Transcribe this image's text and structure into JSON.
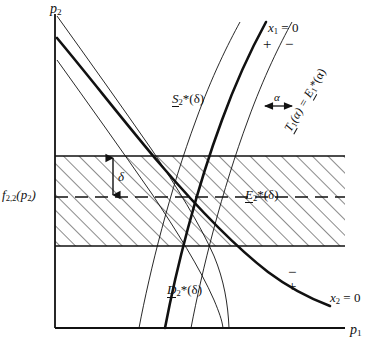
{
  "figure": {
    "type": "economic-phase-diagram",
    "background_color": "#ffffff",
    "line_color": "#111111",
    "axes": {
      "y_axis_label": "p",
      "y_axis_label_sub": "2",
      "x_axis_label": "p",
      "x_axis_label_sub": "1",
      "origin_x": 55,
      "origin_y": 328,
      "y_axis_top": 14,
      "x_axis_right": 345
    },
    "band": {
      "top_y": 156,
      "bottom_y": 246,
      "center_dashed_y": 197,
      "hatch_angle_deg": 45,
      "hatch_spacing": 11,
      "delta_label": "δ",
      "delta_arrow_top_y": 156,
      "delta_arrow_bottom_y": 197
    },
    "axis_left_value_label": {
      "text": "f",
      "subscript": "2,2",
      "paren": "(p",
      "paren_sub": "2",
      "paren_close": ")",
      "full_text": "f2,2(p2)"
    },
    "curves": [
      {
        "name": "x1-zero-curve",
        "style": "thick",
        "label": "x1 = 0",
        "label_main": "x",
        "label_sub": "1",
        "label_tail": " = 0",
        "sign_left": "+",
        "sign_right": "−"
      },
      {
        "name": "x2-zero-curve",
        "style": "thick",
        "label": "x2 = 0",
        "label_main": "x",
        "label_sub": "2",
        "label_tail": " = 0",
        "sign_upper": "−",
        "sign_lower": "+"
      },
      {
        "name": "supply-offset-curve-left",
        "style": "thin"
      },
      {
        "name": "supply-offset-curve-right",
        "style": "thin"
      },
      {
        "name": "demand-offset-curve-left",
        "style": "thin"
      },
      {
        "name": "demand-offset-curve-right",
        "style": "thin"
      }
    ],
    "region_labels": [
      {
        "name": "supply-region-label",
        "letter": "S",
        "sub": "2",
        "tail": "*(δ)",
        "underlined_letter": true,
        "x": 172,
        "y": 92
      },
      {
        "name": "excess-region-label",
        "letter": "E",
        "sub": "2",
        "tail": "*(δ)",
        "underlined_letter": true,
        "x": 245,
        "y": 188
      },
      {
        "name": "demand-region-label",
        "letter": "D",
        "sub": "2",
        "tail": "*(δ)",
        "underlined_letter": true,
        "x": 167,
        "y": 283
      }
    ],
    "rotated_label": {
      "name": "transfer-function-label",
      "text": "T1(α) = E1*(α)",
      "part_t": "T",
      "part_t_sub": "1",
      "part_mid": "(α) = ",
      "part_e": "E",
      "part_e_sub": "1",
      "part_tail": "*(α)",
      "rotation_deg": -60,
      "x": 300,
      "y": 122
    },
    "alpha_marker": {
      "name": "alpha-gap-arrow",
      "label": "α",
      "x": 277,
      "y": 96
    }
  }
}
